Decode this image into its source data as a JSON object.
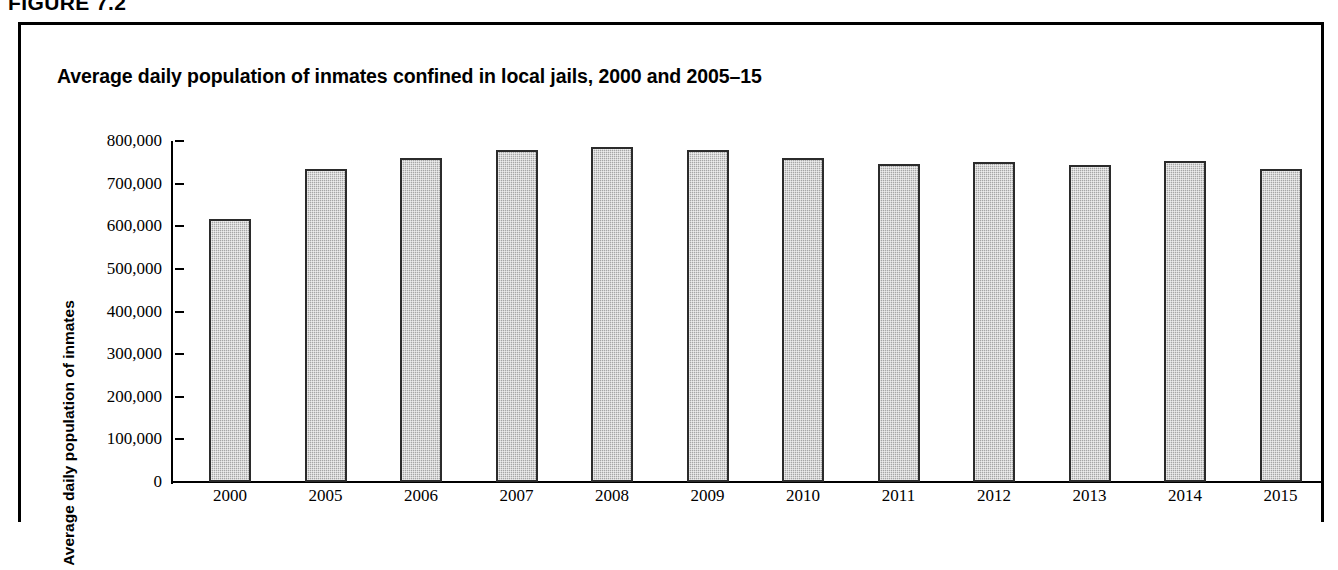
{
  "figure": {
    "number_label": "FIGURE 7.2"
  },
  "chart_data": {
    "type": "bar",
    "title": "Average daily population of inmates confined in local jails, 2000 and 2005–15",
    "xlabel": "",
    "ylabel": "Average daily population of inmates",
    "categories": [
      "2000",
      "2005",
      "2006",
      "2007",
      "2008",
      "2009",
      "2010",
      "2011",
      "2012",
      "2013",
      "2014",
      "2015"
    ],
    "values": [
      618000,
      735000,
      760000,
      780000,
      785000,
      778000,
      760000,
      747000,
      750000,
      743000,
      754000,
      735000
    ],
    "ylim": [
      0,
      800000
    ],
    "ytick_labels": [
      "800,000",
      "700,000",
      "600,000",
      "500,000",
      "400,000",
      "300,000",
      "200,000",
      "100,000",
      "0"
    ],
    "ytick_values": [
      800000,
      700000,
      600000,
      500000,
      400000,
      300000,
      200000,
      100000,
      0
    ],
    "grid": false,
    "legend": null,
    "bar_fill_color": "#a6a6a6",
    "bar_border_color": "#2b2b2b",
    "axis_color": "#000000"
  }
}
